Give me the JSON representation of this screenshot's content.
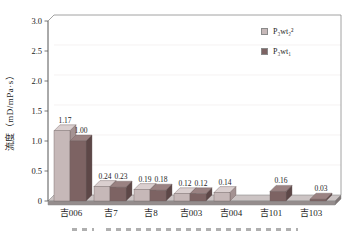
{
  "chart_data": {
    "type": "bar",
    "style": "3d-column",
    "title": "",
    "xlabel": "",
    "ylabel": "流度（mD/mPa·s）",
    "ylim": [
      0,
      3.0
    ],
    "yticks": [
      "3.0",
      "2.5",
      "2.0",
      "1.5",
      "1.0",
      "0.5",
      "0"
    ],
    "grid": "none",
    "legend_position": "top-right-inside",
    "categories": [
      "吉006",
      "吉7",
      "吉8",
      "吉003",
      "吉004",
      "吉101",
      "吉103"
    ],
    "series": [
      {
        "name": "P₃wt₂²",
        "values": [
          1.17,
          0.24,
          0.19,
          0.12,
          0.14,
          null,
          null
        ],
        "labels": [
          "1.17",
          "0.24",
          "0.19",
          "0.12",
          "0.14",
          "",
          ""
        ],
        "color": {
          "front": "#c6b8b8",
          "top": "#dacfcf",
          "side": "#a49292"
        }
      },
      {
        "name": "P₃wt₁",
        "values": [
          1.0,
          0.23,
          0.18,
          0.12,
          null,
          0.16,
          0.03
        ],
        "labels": [
          "1.00",
          "0.23",
          "0.18",
          "0.12",
          "",
          "0.16",
          "0.03"
        ],
        "color": {
          "front": "#7d6363",
          "top": "#9a8282",
          "side": "#5d4747"
        }
      }
    ]
  },
  "frame": {
    "line_color": "#8a8a8a",
    "gridline_color": "#f0eded",
    "floor_top": "#ccc4c4",
    "floor_front": "#958d8d",
    "floor_side": "#7e7575",
    "text_color": "#1c1c1c"
  }
}
